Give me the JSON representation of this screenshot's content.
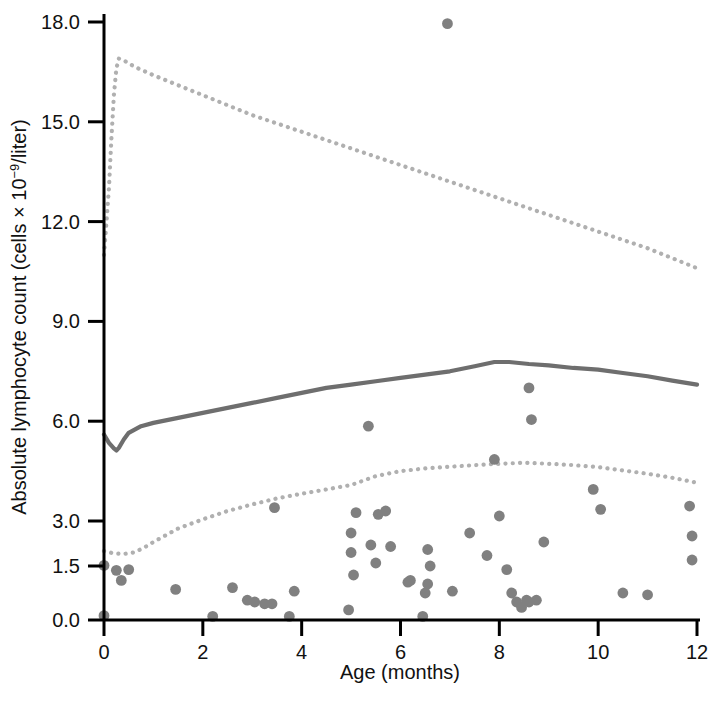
{
  "chart_data": {
    "type": "scatter",
    "title": "",
    "xlabel": "Age (months)",
    "ylabel_parts": {
      "before": "Absolute lymphocyte count (cells × 10",
      "exponent": "−9",
      "after": "/liter)"
    },
    "ylabel": "Absolute lymphocyte count (cells × 10−9/liter)",
    "xlim": [
      0,
      12
    ],
    "ylim": [
      0,
      18
    ],
    "grid": false,
    "legend": "none",
    "xticks": [
      0,
      2,
      4,
      6,
      8,
      10,
      12
    ],
    "xtick_labels": [
      "0",
      "2",
      "4",
      "6",
      "8",
      "10",
      "12"
    ],
    "yticks": [
      0.0,
      1.5,
      3.0,
      6.0,
      9.0,
      12.0,
      15.0,
      18.0
    ],
    "ytick_labels": [
      "0.0",
      "1.5",
      "3.0",
      "6.0",
      "9.0",
      "12.0",
      "15.0",
      "18.0"
    ],
    "y_axis_note": "non-linear below 3.0: 0.0, 1.5 and 3.0 are evenly spaced with the 3.0-18.0 range linear",
    "colors": {
      "marker": "#808080",
      "median_line": "#6e6e6e",
      "percentile_line": "#b0b0b0",
      "axis": "#000000",
      "background": "#ffffff",
      "text": "#111111"
    },
    "series": [
      {
        "name": "97.5th percentile",
        "style": "dotted",
        "color": "#b0b0b0",
        "x": [
          0.0,
          0.1,
          0.15,
          0.2,
          0.25,
          0.3,
          0.4,
          0.5,
          0.7,
          1.0,
          1.5,
          2.0,
          2.5,
          3.0,
          3.5,
          4.0,
          4.5,
          5.0,
          5.5,
          6.0,
          6.5,
          7.0,
          7.5,
          8.0,
          8.5,
          9.0,
          9.5,
          10.0,
          10.5,
          11.0,
          11.5,
          12.0
        ],
        "y": [
          11.0,
          13.0,
          14.5,
          15.8,
          16.6,
          16.9,
          16.85,
          16.75,
          16.6,
          16.4,
          16.1,
          15.8,
          15.5,
          15.2,
          14.95,
          14.7,
          14.45,
          14.2,
          13.95,
          13.7,
          13.45,
          13.2,
          12.95,
          12.7,
          12.45,
          12.2,
          11.95,
          11.7,
          11.45,
          11.2,
          10.9,
          10.6
        ]
      },
      {
        "name": "median",
        "style": "solid",
        "color": "#6e6e6e",
        "x": [
          0.0,
          0.1,
          0.2,
          0.25,
          0.3,
          0.4,
          0.5,
          0.75,
          1.0,
          1.5,
          2.0,
          2.5,
          3.0,
          3.5,
          4.0,
          4.5,
          5.0,
          5.5,
          6.0,
          6.5,
          7.0,
          7.5,
          7.9,
          8.2,
          8.6,
          9.0,
          9.5,
          10.0,
          10.5,
          11.0,
          11.5,
          12.0
        ],
        "y": [
          5.6,
          5.35,
          5.18,
          5.12,
          5.2,
          5.45,
          5.65,
          5.85,
          5.95,
          6.1,
          6.25,
          6.4,
          6.55,
          6.7,
          6.85,
          7.0,
          7.1,
          7.2,
          7.3,
          7.4,
          7.5,
          7.65,
          7.78,
          7.78,
          7.72,
          7.68,
          7.6,
          7.55,
          7.45,
          7.35,
          7.22,
          7.1
        ]
      },
      {
        "name": "2.5th percentile",
        "style": "dotted",
        "color": "#b0b0b0",
        "x": [
          0.0,
          0.2,
          0.4,
          0.6,
          0.8,
          1.0,
          1.5,
          2.0,
          2.5,
          3.0,
          3.5,
          4.0,
          4.5,
          5.0,
          5.5,
          6.0,
          6.5,
          7.0,
          7.5,
          8.0,
          8.5,
          9.0,
          9.5,
          10.0,
          10.5,
          11.0,
          11.5,
          12.0
        ],
        "y": [
          2.0,
          1.92,
          1.9,
          1.95,
          2.1,
          2.3,
          2.75,
          3.05,
          3.3,
          3.5,
          3.68,
          3.82,
          3.95,
          4.08,
          4.35,
          4.5,
          4.58,
          4.63,
          4.68,
          4.72,
          4.75,
          4.72,
          4.68,
          4.62,
          4.52,
          4.42,
          4.3,
          4.15
        ]
      }
    ],
    "scatter": {
      "name": "patient measurements",
      "marker": "circle",
      "color": "#808080",
      "points": [
        [
          0.0,
          1.52
        ],
        [
          0.0,
          0.12
        ],
        [
          0.25,
          1.38
        ],
        [
          0.5,
          1.4
        ],
        [
          0.35,
          1.1
        ],
        [
          1.45,
          0.85
        ],
        [
          2.2,
          0.1
        ],
        [
          2.6,
          0.9
        ],
        [
          2.9,
          0.55
        ],
        [
          3.05,
          0.5
        ],
        [
          3.25,
          0.45
        ],
        [
          3.4,
          0.45
        ],
        [
          3.45,
          3.4
        ],
        [
          3.75,
          0.1
        ],
        [
          3.85,
          0.8
        ],
        [
          4.95,
          0.28
        ],
        [
          5.0,
          2.6
        ],
        [
          5.05,
          1.25
        ],
        [
          5.1,
          3.25
        ],
        [
          5.0,
          1.95
        ],
        [
          5.35,
          5.85
        ],
        [
          5.4,
          2.2
        ],
        [
          5.5,
          1.6
        ],
        [
          5.55,
          3.2
        ],
        [
          5.7,
          3.3
        ],
        [
          5.8,
          2.15
        ],
        [
          6.15,
          1.05
        ],
        [
          6.2,
          1.1
        ],
        [
          6.45,
          0.1
        ],
        [
          6.5,
          0.75
        ],
        [
          6.55,
          2.05
        ],
        [
          6.6,
          1.5
        ],
        [
          6.55,
          1.0
        ],
        [
          6.95,
          17.95
        ],
        [
          7.05,
          0.8
        ],
        [
          7.4,
          2.6
        ],
        [
          7.75,
          1.85
        ],
        [
          7.9,
          4.85
        ],
        [
          8.0,
          3.15
        ],
        [
          8.15,
          1.4
        ],
        [
          8.25,
          0.75
        ],
        [
          8.35,
          0.5
        ],
        [
          8.45,
          0.35
        ],
        [
          8.55,
          0.55
        ],
        [
          8.6,
          0.5
        ],
        [
          8.6,
          7.0
        ],
        [
          8.65,
          6.05
        ],
        [
          8.75,
          0.55
        ],
        [
          8.9,
          2.3
        ],
        [
          9.9,
          3.95
        ],
        [
          10.05,
          3.35
        ],
        [
          10.5,
          0.75
        ],
        [
          11.0,
          0.7
        ],
        [
          11.85,
          3.45
        ],
        [
          11.9,
          2.5
        ],
        [
          11.9,
          1.7
        ]
      ]
    }
  }
}
